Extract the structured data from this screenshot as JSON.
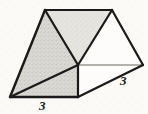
{
  "figure": {
    "kind": "geometric-solid-sketch",
    "medium": "pencil sketch on aged paper",
    "canvas": {
      "width": 148,
      "height": 114
    },
    "colors": {
      "paper": "#fbfaf7",
      "stroke": "#1a1a1a",
      "faint_stroke": "#9a9a94",
      "shade_fill": "#d2d0cb",
      "shade_fill_light": "#dedcd7",
      "label_text": "#1c1c1c"
    },
    "vertices": {
      "front_apex": {
        "name": "front-top-apex",
        "x": 45,
        "y": 10
      },
      "back_apex": {
        "name": "back-top-apex",
        "x": 112,
        "y": 10
      },
      "center_vertex": {
        "name": "center-junction",
        "x": 78,
        "y": 65
      },
      "right_vertex": {
        "name": "right-vertex",
        "x": 143,
        "y": 65
      },
      "bottom_left": {
        "name": "bottom-left",
        "x": 10,
        "y": 97
      },
      "bottom_mid": {
        "name": "bottom-mid-right",
        "x": 78,
        "y": 97
      }
    },
    "faces": [
      {
        "name": "left-large-shaded-triangle",
        "points": "45,10 78,65 10,97",
        "shaded": true
      },
      {
        "name": "top-shaded-parallelogram",
        "points": "45,10 112,10 78,65",
        "shaded": true
      },
      {
        "name": "bottom-shaded-face",
        "points": "10,97 78,65 78,97",
        "shaded": true
      },
      {
        "name": "right-unshaded-triangle",
        "points": "112,10 143,65 78,65",
        "shaded": false
      },
      {
        "name": "lower-right-unshaded-face",
        "points": "78,65 143,65 78,97",
        "shaded": false
      }
    ],
    "edges": [
      {
        "name": "edge-top-ridge",
        "x1": 45,
        "y1": 10,
        "x2": 112,
        "y2": 10,
        "style": "solid",
        "weight": 2.2
      },
      {
        "name": "edge-front-left-slope",
        "x1": 45,
        "y1": 10,
        "x2": 10,
        "y2": 97,
        "style": "solid",
        "weight": 2.4
      },
      {
        "name": "edge-front-right-slope",
        "x1": 45,
        "y1": 10,
        "x2": 78,
        "y2": 65,
        "style": "solid",
        "weight": 2.2
      },
      {
        "name": "edge-back-left-slope",
        "x1": 112,
        "y1": 10,
        "x2": 78,
        "y2": 65,
        "style": "solid",
        "weight": 2.2
      },
      {
        "name": "edge-back-right-slope",
        "x1": 112,
        "y1": 10,
        "x2": 143,
        "y2": 65,
        "style": "solid",
        "weight": 2.2
      },
      {
        "name": "edge-diagonal-to-corner",
        "x1": 78,
        "y1": 65,
        "x2": 10,
        "y2": 97,
        "style": "solid",
        "weight": 2.2
      },
      {
        "name": "edge-base-front",
        "x1": 10,
        "y1": 97,
        "x2": 78,
        "y2": 97,
        "style": "solid",
        "weight": 2.4
      },
      {
        "name": "edge-base-right-slope",
        "x1": 78,
        "y1": 97,
        "x2": 143,
        "y2": 65,
        "style": "solid",
        "weight": 2.2
      },
      {
        "name": "edge-vertical-center",
        "x1": 78,
        "y1": 65,
        "x2": 78,
        "y2": 97,
        "style": "solid",
        "weight": 2.2
      },
      {
        "name": "edge-hidden-horizontal",
        "x1": 78,
        "y1": 65,
        "x2": 143,
        "y2": 65,
        "style": "faint",
        "weight": 1.3
      }
    ],
    "labels": [
      {
        "name": "base-length-label",
        "text": "3",
        "x": 39,
        "y": 99,
        "edge": "edge-base-front"
      },
      {
        "name": "right-length-label",
        "text": "3",
        "x": 120,
        "y": 74,
        "edge": "edge-base-right-slope"
      }
    ]
  }
}
